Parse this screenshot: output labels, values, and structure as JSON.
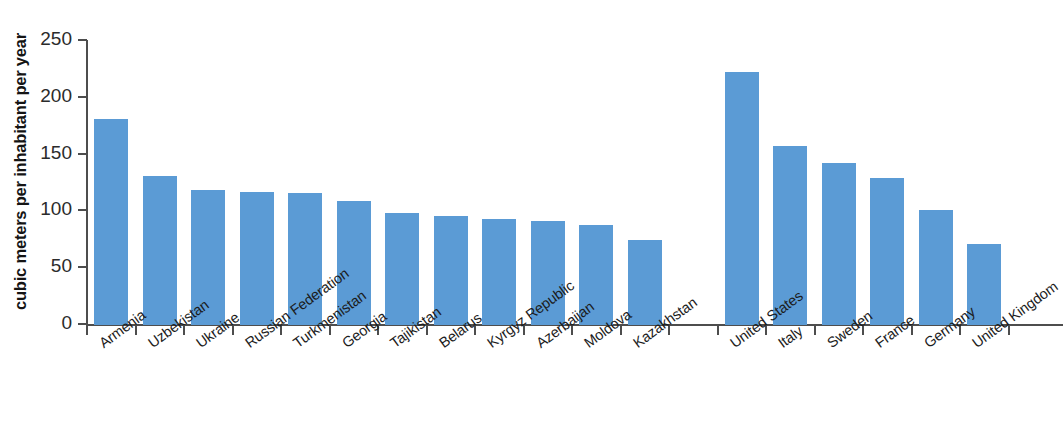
{
  "chart_data": {
    "type": "bar",
    "title": "",
    "subtitle": "",
    "xlabel": "",
    "ylabel": "cubic meters per inhabitant per year",
    "ylim": [
      0,
      250
    ],
    "yticks": [
      0,
      50,
      100,
      150,
      200,
      250
    ],
    "ytick_labels": [
      "0",
      "50",
      "100",
      "150",
      "200",
      "250"
    ],
    "grid": false,
    "legend": null,
    "bar_color": "#5b9bd5",
    "axis_color": "#4d4d4d",
    "categories": [
      "Armenia",
      "Uzbekistan",
      "Ukraine",
      "Russian Federation",
      "Turkmenistan",
      "Georgia",
      "Tajikistan",
      "Belarus",
      "Kyrgyz Republic",
      "Azerbaijan",
      "Moldova",
      "Kazakhstan",
      "",
      "United States",
      "Italy",
      "Sweden",
      "France",
      "Germany",
      "United Kingdom"
    ],
    "values": [
      181,
      131,
      119,
      117,
      116,
      109,
      99,
      96,
      93,
      92,
      88,
      75,
      null,
      223,
      158,
      143,
      129,
      101,
      71
    ]
  }
}
